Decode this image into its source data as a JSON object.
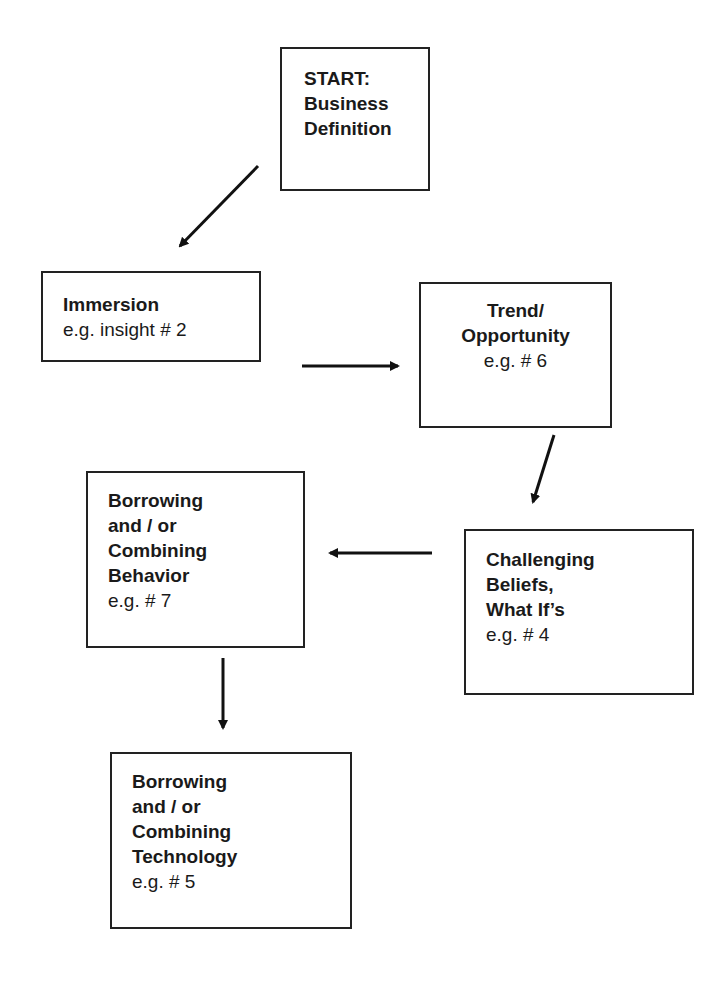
{
  "diagram": {
    "nodes": [
      {
        "id": "start",
        "lines": [
          "START:",
          "Business",
          "Definition"
        ],
        "example": ""
      },
      {
        "id": "immersion",
        "lines": [
          "Immersion"
        ],
        "example": "e.g. insight # 2"
      },
      {
        "id": "trend",
        "lines": [
          "Trend/",
          "Opportunity"
        ],
        "example": "e.g. # 6"
      },
      {
        "id": "challenging",
        "lines": [
          "Challenging",
          "Beliefs,",
          "What If’s"
        ],
        "example": "e.g. # 4"
      },
      {
        "id": "behavior",
        "lines": [
          "Borrowing",
          "and / or",
          "Combining",
          "Behavior"
        ],
        "example": "e.g. #  7"
      },
      {
        "id": "technology",
        "lines": [
          "Borrowing",
          "and / or",
          "Combining",
          "Technology"
        ],
        "example": "e.g. #  5"
      }
    ],
    "edges": [
      {
        "from": "start",
        "to": "immersion"
      },
      {
        "from": "immersion",
        "to": "trend"
      },
      {
        "from": "trend",
        "to": "challenging"
      },
      {
        "from": "challenging",
        "to": "behavior"
      },
      {
        "from": "behavior",
        "to": "technology"
      }
    ]
  }
}
